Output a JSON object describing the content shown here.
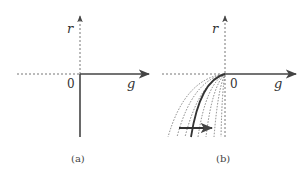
{
  "panels": [
    {
      "id": "a",
      "caption": "(a)",
      "axis_y_label": "r",
      "axis_x_label": "g",
      "origin_label": "0",
      "description": "Solid ray along positive g-axis and solid ray along negative r-axis; dashed negative g-axis and dashed positive r-axis."
    },
    {
      "id": "b",
      "caption": "(b)",
      "axis_y_label": "r",
      "axis_x_label": "g",
      "origin_label": "0",
      "description": "Solid ray along positive g-axis; family of thin dashed curves emanating from origin into third quadrant with one bold curve; horizontal arrow pointing right across the curves."
    }
  ],
  "colors": {
    "axis": "#555555",
    "solid": "#444444",
    "dashed": "#777777"
  }
}
